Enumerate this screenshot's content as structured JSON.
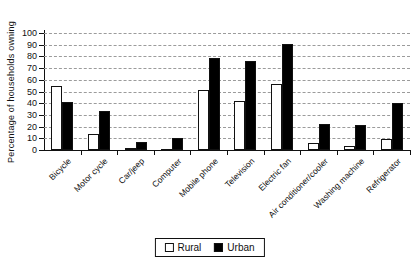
{
  "chart_data": {
    "type": "bar",
    "title": "",
    "ylabel": "Percentage of households owning",
    "xlabel": "",
    "ylim": [
      0,
      100
    ],
    "ytick_step": 10,
    "grid": "horizontal-dashed",
    "legend_position": "bottom-center",
    "categories": [
      "Bicycle",
      "Motor cycle",
      "Car/jeep",
      "Computer",
      "Mobile phone",
      "Television",
      "Electric fan",
      "Air conditioner/cooler",
      "Washing machine",
      "Refrigerator"
    ],
    "series": [
      {
        "name": "Rural",
        "fill": "#ffffff",
        "values": [
          55,
          14,
          2,
          1,
          51,
          42,
          56,
          6,
          3,
          9
        ]
      },
      {
        "name": "Urban",
        "fill": "#000000",
        "values": [
          41,
          33,
          7,
          10,
          79,
          76,
          91,
          22,
          21,
          40
        ]
      }
    ]
  },
  "colors": {
    "axis": "#111111",
    "grid": "#9b9b9b",
    "background": "#ffffff",
    "rural_fill": "#ffffff",
    "urban_fill": "#000000"
  }
}
